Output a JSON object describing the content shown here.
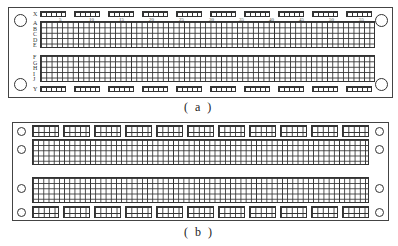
{
  "figures": [
    {
      "id": "a",
      "caption": "( a )",
      "bus_rows": [
        {
          "label": "X"
        },
        {
          "label": "Y"
        }
      ],
      "terminal_rows_top": [
        "A",
        "B",
        "C",
        "D",
        "E"
      ],
      "terminal_rows_bottom": [
        "F",
        "G",
        "H",
        "I",
        "J"
      ],
      "column_numbers": [
        "5",
        "10",
        "15",
        "20",
        "25",
        "30",
        "35",
        "40",
        "45",
        "50",
        "55",
        "60"
      ],
      "bus_blocks_per_row": 10,
      "bus_block": {
        "rows": 1,
        "cols": 5
      },
      "mounting_holes": 4
    },
    {
      "id": "b",
      "caption": "( b )",
      "bus_blocks_per_row": 11,
      "bus_block": {
        "rows": 2,
        "cols": 5
      },
      "terminal_strips": 2,
      "terminal_strip_rows": 5,
      "mounting_holes": 8
    }
  ]
}
